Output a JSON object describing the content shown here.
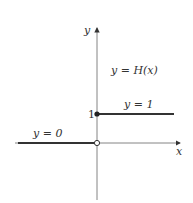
{
  "diagram": {
    "title": "y = H(x)",
    "axes": {
      "x_label": "x",
      "y_label": "y"
    },
    "tick_labels": {
      "y_one": "1"
    },
    "segments": [
      {
        "label": "y = 0",
        "from_x": "-inf",
        "to_x": 0,
        "y": 0,
        "endpoint_at_0": "open"
      },
      {
        "label": "y = 1",
        "from_x": 0,
        "to_x": "+inf",
        "y": 1,
        "endpoint_at_0": "closed"
      }
    ],
    "colors": {
      "line": "#333333",
      "axis": "#777777"
    }
  }
}
